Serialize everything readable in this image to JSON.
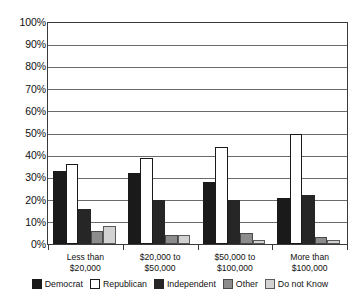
{
  "chart_data": {
    "type": "bar",
    "title": "",
    "subtitle": "",
    "xlabel": "",
    "ylabel": "",
    "ylim": [
      0,
      100
    ],
    "ytick_labels": [
      "100%",
      "90%",
      "80%",
      "70%",
      "60%",
      "50%",
      "40%",
      "30%",
      "20%",
      "10%",
      "0%"
    ],
    "ytick_values": [
      100,
      90,
      80,
      70,
      60,
      50,
      40,
      30,
      20,
      10,
      0
    ],
    "grid": true,
    "legend_position": "bottom",
    "categories": [
      "Less than $20,000",
      "$20,000 to $50,000",
      "$50,000 to $100,000",
      "More than $100,000"
    ],
    "category_lines": [
      [
        "Less than",
        "$20,000"
      ],
      [
        "$20,000 to",
        "$50,000"
      ],
      [
        "$50,000 to",
        "$100,000"
      ],
      [
        "More than",
        "$100,000"
      ]
    ],
    "series": [
      {
        "name": "Democrat",
        "color": "#1a1a1a",
        "border": "#1a1a1a",
        "values": [
          33,
          32,
          28,
          21
        ]
      },
      {
        "name": "Republican",
        "color": "#ffffff",
        "border": "#1a1a1a",
        "values": [
          36,
          39,
          44,
          50
        ]
      },
      {
        "name": "Independent",
        "color": "#262626",
        "border": "#262626",
        "values": [
          16,
          20,
          20,
          22
        ]
      },
      {
        "name": "Other",
        "color": "#8c8c8c",
        "border": "#4a4a4a",
        "values": [
          6,
          4,
          5,
          3
        ]
      },
      {
        "name": "Do not Know",
        "color": "#d2d2d2",
        "border": "#5a5a5a",
        "values": [
          8,
          4,
          2,
          2
        ]
      }
    ]
  },
  "legend": {
    "items": [
      {
        "label": "Democrat"
      },
      {
        "label": "Republican"
      },
      {
        "label": "Independent"
      },
      {
        "label": "Other"
      },
      {
        "label": "Do not Know"
      }
    ]
  }
}
